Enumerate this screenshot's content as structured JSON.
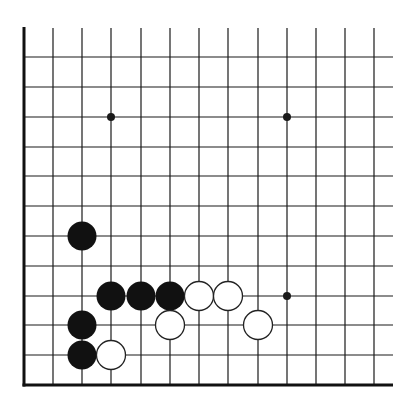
{
  "board": {
    "description": "Go problem diagram, lower-left corner of board",
    "columns_x": [
      24,
      53,
      82,
      111,
      141,
      170,
      199,
      228,
      258,
      287,
      316,
      345,
      374
    ],
    "rows_y_from_bottom": [
      385,
      355,
      325,
      296,
      266,
      236,
      206,
      176,
      147,
      117,
      87,
      57
    ],
    "top_open_y": 28,
    "right_open_x": 393,
    "left_edge": true,
    "bottom_edge": true,
    "line_color": "#1a1a1a",
    "edge_color": "#111111",
    "stone_radius": 14.5
  },
  "star_points": [
    {
      "col": 3,
      "row": 9
    },
    {
      "col": 9,
      "row": 9
    },
    {
      "col": 9,
      "row": 3
    }
  ],
  "stones": [
    {
      "color": "black",
      "col": 2,
      "row": 5
    },
    {
      "color": "black",
      "col": 3,
      "row": 3
    },
    {
      "color": "black",
      "col": 4,
      "row": 3
    },
    {
      "color": "black",
      "col": 5,
      "row": 3
    },
    {
      "color": "white",
      "col": 6,
      "row": 3
    },
    {
      "color": "white",
      "col": 7,
      "row": 3
    },
    {
      "color": "black",
      "col": 2,
      "row": 2
    },
    {
      "color": "white",
      "col": 5,
      "row": 2
    },
    {
      "color": "white",
      "col": 8,
      "row": 2
    },
    {
      "color": "black",
      "col": 2,
      "row": 1
    },
    {
      "color": "white",
      "col": 3,
      "row": 1
    }
  ],
  "colors": {
    "black_stone": "#111111",
    "white_stone": "#ffffff",
    "white_stone_outline": "#222222",
    "background": "#ffffff"
  }
}
